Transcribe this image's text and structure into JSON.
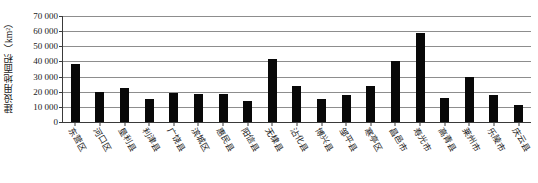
{
  "chart_data": {
    "type": "bar",
    "title": "",
    "xlabel": "",
    "ylabel": "建设用地面积（km²）",
    "ylim": [
      0,
      70000
    ],
    "ytick_values": [
      0,
      10000,
      20000,
      30000,
      40000,
      50000,
      60000,
      70000
    ],
    "ytick_labels": [
      "0",
      "10 000",
      "20 000",
      "30 000",
      "40 000",
      "50 000",
      "60 000",
      "70 000"
    ],
    "grid": true,
    "legend": "none",
    "bar_color": "#080808",
    "axis_color": "#3a3a3a",
    "gridline_color": "#8d8d8d",
    "categories": [
      "东营区",
      "河口区",
      "垦利县",
      "利津县",
      "广饶县",
      "滨城区",
      "惠民县",
      "阳信县",
      "无棣县",
      "沾化县",
      "博兴县",
      "邹平县",
      "寒亭区",
      "昌邑市",
      "寿光市",
      "昌southern",
      "莱州市",
      "乐陵市",
      "庆云县",
      "庆云县"
    ],
    "labels": [
      "东营区",
      "河口区",
      "垦利县",
      "利津县",
      "广饶县",
      "滨城区",
      "惠民县",
      "阳信县",
      "无棣县",
      "沾化县",
      "博兴县",
      "邹平县",
      "寒亭区",
      "昌邑市",
      "寿光市",
      "寒亭县",
      "莱州市",
      "乐陵市",
      "庆云县",
      "庆云县"
    ],
    "values": [
      38000,
      20000,
      22500,
      15500,
      19000,
      18700,
      18300,
      14000,
      41500,
      24000,
      15500,
      17600,
      23500,
      40000,
      59000,
      15800,
      30000,
      18000,
      11500,
      11500
    ]
  },
  "xaxis_labels": [
    "东营区",
    "河口区",
    "垦利县",
    "利津县",
    "广饶县",
    "滨城区",
    "惠民县",
    "阳信县",
    "无棣县",
    "沾化县",
    "博兴县",
    "邹平县",
    "寒亭区",
    "昌邑市",
    "寿光市",
    "高青县",
    "莱州市",
    "乐陵市",
    "庆云县"
  ]
}
